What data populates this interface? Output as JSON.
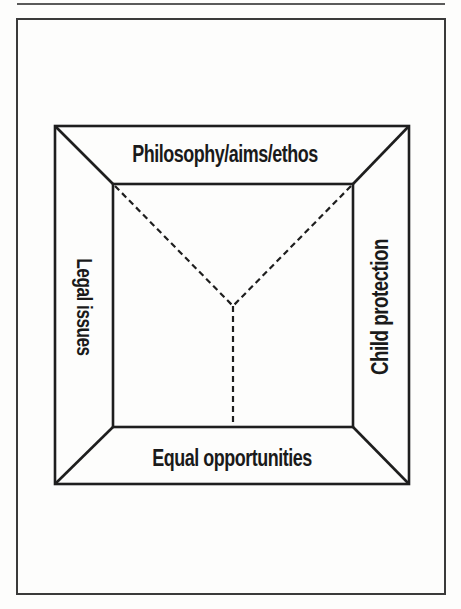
{
  "figure": {
    "type": "framed-box-diagram",
    "labels": {
      "top": "Philosophy/aims/ethos",
      "left": "Legal issues",
      "right": "Child protection",
      "bottom": "Equal opportunities"
    },
    "colors": {
      "line": "#1e1e1e",
      "text": "#1a1a1a",
      "frame": "#3a3a3a",
      "paper": "#fdfdfc"
    },
    "geometry": {
      "outer_box": {
        "x1": 55,
        "y1": 126,
        "x2": 409,
        "y2": 484
      },
      "inner_box": {
        "x1": 113,
        "y1": 184,
        "x2": 353,
        "y2": 427
      },
      "dashed_junction": {
        "x": 233,
        "y": 306
      }
    }
  }
}
